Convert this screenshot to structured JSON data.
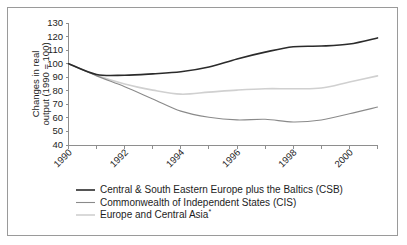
{
  "chart_data": {
    "type": "line",
    "title": "",
    "xlabel": "",
    "ylabel": "Changes in real output (1990 = 100)",
    "ylabel_line1": "Changes in real",
    "ylabel_line2": "output (1990 = 100)",
    "x": [
      1990,
      1991,
      1992,
      1993,
      1994,
      1995,
      1996,
      1997,
      1998,
      1999,
      2000,
      2001
    ],
    "xlim": [
      1990,
      2001
    ],
    "ylim": [
      40,
      130
    ],
    "yticks": [
      40,
      50,
      60,
      70,
      80,
      90,
      100,
      110,
      120,
      130
    ],
    "ytick_labels": [
      "40",
      "50",
      "60",
      "70",
      "80",
      "90",
      "100",
      "110",
      "120",
      "130"
    ],
    "xticks": [
      1990,
      1991,
      1992,
      1993,
      1994,
      1995,
      1996,
      1997,
      1998,
      1999,
      2000,
      2001
    ],
    "xtick_labels_shown": [
      "1990",
      "1992",
      "1994",
      "1996",
      "1998",
      "2000"
    ],
    "xtick_label_rotation": 45,
    "grid": false,
    "legend_position": "below",
    "series": [
      {
        "name": "Central & South Eastern Europe plus the Baltics (CSB)",
        "color": "#2b2b2b",
        "width": 1.6,
        "values": [
          100,
          92.0,
          91.5,
          92.5,
          94.0,
          97.5,
          103.5,
          108.5,
          112.5,
          113.0,
          114.5,
          119.0
        ]
      },
      {
        "name": "Commonwealth of Independent States (CIS)",
        "color": "#8a8a8a",
        "width": 1.1,
        "values": [
          100,
          91.0,
          83.0,
          74.0,
          65.0,
          60.5,
          58.5,
          59.0,
          57.0,
          58.5,
          63.0,
          68.0
        ]
      },
      {
        "name": "Europe and Central Asia",
        "name_suffix": "*",
        "color": "#d0d0d0",
        "width": 1.6,
        "values": [
          100,
          91.5,
          85.0,
          80.5,
          77.5,
          79.0,
          80.5,
          81.5,
          81.5,
          82.0,
          86.5,
          91.0
        ]
      }
    ]
  },
  "legend": {
    "items": [
      {
        "label": "Central & South Eastern Europe plus the Baltics (CSB)",
        "suffix": "",
        "color": "#2b2b2b",
        "width": 1.6
      },
      {
        "label": "Commonwealth of Independent States (CIS)",
        "suffix": "",
        "color": "#8a8a8a",
        "width": 1.1
      },
      {
        "label": "Europe and Central Asia",
        "suffix": "*",
        "color": "#d0d0d0",
        "width": 1.6
      }
    ]
  },
  "colors": {
    "frame_border": "#9a9a9a",
    "axis": "#8e8e8e",
    "text": "#1d1d1d",
    "background": "#ffffff"
  }
}
